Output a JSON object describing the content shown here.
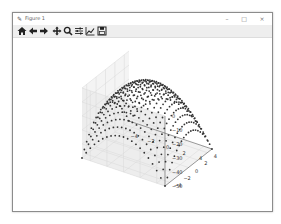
{
  "window": {
    "title": "Figure 1",
    "controls": {
      "minimize": "–",
      "maximize": "□",
      "close": "×"
    }
  },
  "toolbar": {
    "items": [
      {
        "name": "home",
        "icon": "home-icon"
      },
      {
        "name": "back",
        "icon": "arrow-left-icon"
      },
      {
        "name": "forward",
        "icon": "arrow-right-icon"
      },
      {
        "name": "pan",
        "icon": "move-icon"
      },
      {
        "name": "zoom",
        "icon": "zoom-icon"
      },
      {
        "name": "configure-subplots",
        "icon": "sliders-icon"
      },
      {
        "name": "edit-axis",
        "icon": "line-chart-icon"
      },
      {
        "name": "save",
        "icon": "save-icon"
      }
    ]
  },
  "colors": {
    "points": "#333333",
    "pane": "#f2f2f2",
    "grid": "#d9d9d9",
    "edge": "#555555"
  },
  "chart_data": {
    "type": "scatter",
    "subtype": "3d",
    "title": "",
    "function": "z = -(x^2 + y^2)",
    "x": [
      -5,
      -4,
      -3,
      -2,
      -1,
      0,
      1,
      2,
      3,
      4,
      5
    ],
    "y": [
      -5,
      -4,
      -3,
      -2,
      -1,
      0,
      1,
      2,
      3,
      4,
      5
    ],
    "grid_resolution": 21,
    "xlim": [
      -5,
      5
    ],
    "ylim": [
      -5,
      5
    ],
    "zlim": [
      -50,
      0
    ],
    "xticks": [
      "−4",
      "−2",
      "0",
      "2",
      "4"
    ],
    "yticks": [
      "−4",
      "−2",
      "0",
      "2",
      "4"
    ],
    "zticks": [
      "0",
      "−10",
      "−20",
      "−30",
      "−40",
      "−50"
    ],
    "xlabel": "",
    "ylabel": "",
    "zlabel": "",
    "grid": true,
    "legend": null
  }
}
